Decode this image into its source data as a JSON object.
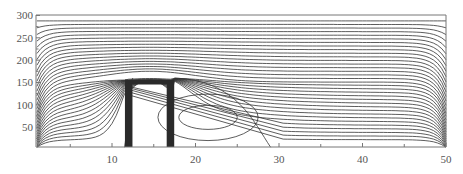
{
  "chart_data": {
    "type": "contour",
    "title": "",
    "xlabel": "",
    "ylabel": "",
    "xlim": [
      1,
      50
    ],
    "ylim": [
      5,
      300
    ],
    "x_ticks": [
      10,
      20,
      30,
      40,
      50
    ],
    "x_minor_ticks": [
      5,
      15,
      25,
      35,
      45
    ],
    "y_ticks": [
      50,
      100,
      150,
      200,
      250,
      300
    ],
    "grid": false,
    "legend": null,
    "obstacle": {
      "x_left": 12,
      "x_right": 17,
      "top": 150,
      "wall_thickness": 0.9
    },
    "vortex": {
      "center_x": 21.5,
      "center_y": 72,
      "rings": [
        {
          "rx": 3.5,
          "ry": 27
        },
        {
          "rx": 6,
          "ry": 52
        }
      ]
    }
  },
  "colors": {
    "line": "#333333",
    "axis": "#777777",
    "obstacle": "#2a2a2a",
    "label": "#555555"
  }
}
